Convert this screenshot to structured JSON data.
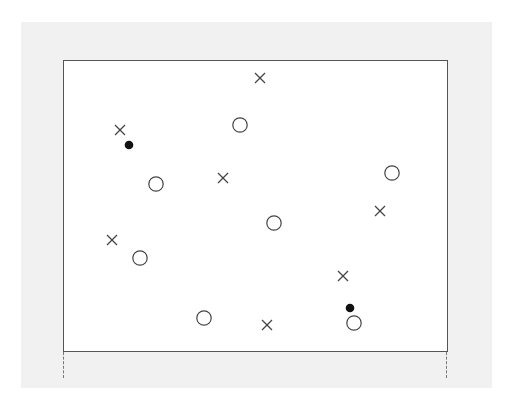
{
  "figure": {
    "colors": {
      "panel_bg": "#f1f1f1",
      "frame_bg": "#ffffff",
      "frame_border": "#555555",
      "marker_stroke": "#444444",
      "filled_dot": "#111111"
    },
    "caption": ""
  },
  "markers": {
    "crosses": [
      {
        "x": 260,
        "y": 78
      },
      {
        "x": 120,
        "y": 130
      },
      {
        "x": 223,
        "y": 178
      },
      {
        "x": 380,
        "y": 211
      },
      {
        "x": 112,
        "y": 240
      },
      {
        "x": 343,
        "y": 276
      },
      {
        "x": 267,
        "y": 325
      }
    ],
    "circles": [
      {
        "x": 240,
        "y": 125
      },
      {
        "x": 156,
        "y": 184
      },
      {
        "x": 392,
        "y": 173
      },
      {
        "x": 274,
        "y": 223
      },
      {
        "x": 140,
        "y": 258
      },
      {
        "x": 204,
        "y": 318
      },
      {
        "x": 354,
        "y": 323
      }
    ],
    "dots": [
      {
        "x": 129,
        "y": 145
      },
      {
        "x": 350,
        "y": 308
      }
    ]
  }
}
